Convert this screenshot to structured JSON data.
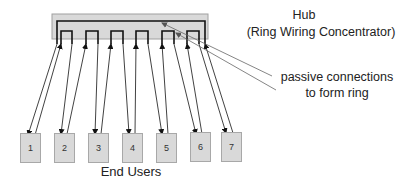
{
  "hub": {
    "title": "Hub",
    "subtitle": "(Ring Wiring Concentrator)",
    "fill": "#d9d9d9",
    "border": "#a0a0a0"
  },
  "annotation": {
    "line1": "passive connections",
    "line2": "to form ring"
  },
  "end_users": {
    "label": "End Users",
    "items": [
      {
        "label": "1"
      },
      {
        "label": "2"
      },
      {
        "label": "3"
      },
      {
        "label": "4"
      },
      {
        "label": "5"
      },
      {
        "label": "6"
      },
      {
        "label": "7"
      }
    ]
  }
}
